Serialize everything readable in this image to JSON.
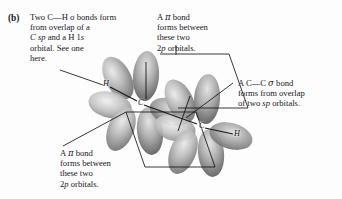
{
  "figure": {
    "panel_label": "(b)",
    "background_color": "#fdfdfd",
    "line_color": "#1a1a1e",
    "lobe_color_light": "#cfcfcf",
    "lobe_color_mid": "#9a9a9a",
    "lobe_color_dark": "#6e6e6e"
  },
  "annotations": {
    "sigma_ch": {
      "name": "sigma-CH-callout",
      "lines": [
        "Two C—H σ bonds form",
        "from overlap of a",
        "C sp and a H 1s",
        "orbital. See one",
        "here."
      ],
      "line1": "Two C—H σ bonds form",
      "line2": "from overlap of a",
      "line3a": "C sp",
      "line3b": " and a H 1",
      "line3c": "s",
      "line4": "orbital. See one",
      "line5": "here."
    },
    "pi_top": {
      "name": "pi-bond-top-callout",
      "line1a": "A ",
      "line1b": "π",
      "line1c": " bond",
      "line2": "forms between",
      "line3": "these two",
      "line4a": "2",
      "line4b": "p",
      "line4c": " orbitals."
    },
    "sigma_cc": {
      "name": "sigma-CC-callout",
      "line1a": "A C—C ",
      "line1b": "σ",
      "line1c": " bond",
      "line2": "forms from overlap",
      "line3a": "of two ",
      "line3b": "sp",
      "line3c": " orbitals."
    },
    "pi_bottom": {
      "name": "pi-bond-bottom-callout",
      "line1a": "A ",
      "line1b": "π",
      "line1c": " bond",
      "line2": "forms between",
      "line3": "these two",
      "line4a": "2",
      "line4b": "p",
      "line4c": " orbitals."
    }
  },
  "molecule": {
    "name": "acetylene-orbital-diagram",
    "atoms": [
      {
        "label": "H",
        "x": 105,
        "y": 84
      },
      {
        "label": "C",
        "x": 140,
        "y": 103
      },
      {
        "label": "C",
        "x": 201,
        "y": 126
      },
      {
        "label": "H",
        "x": 236,
        "y": 134
      }
    ]
  }
}
